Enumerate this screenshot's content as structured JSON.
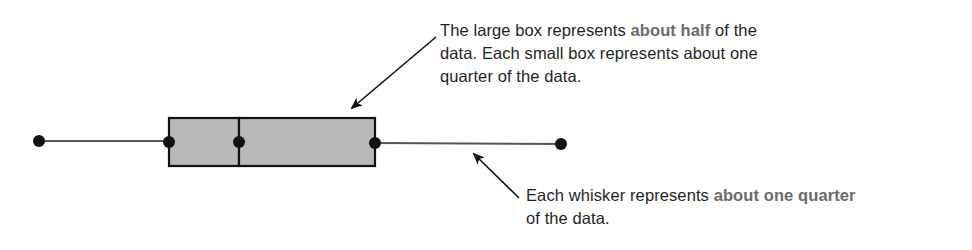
{
  "diagram": {
    "type": "box-and-whisker annotation",
    "colors": {
      "box_fill": "#b9b9b9",
      "outline": "#111111",
      "whisker_line": "#555555",
      "point": "#111111",
      "emphasis_text": "#6b6b6b",
      "body_text": "#1f1f1f"
    },
    "plot": {
      "whisker_y": 142,
      "box_top": 118,
      "box_bottom": 166,
      "points_x": [
        39,
        169,
        239,
        375,
        561
      ],
      "labels": [
        "minimum",
        "lower quartile",
        "median",
        "upper quartile",
        "maximum"
      ]
    }
  },
  "annotations": {
    "box": {
      "part1": "The large box represents ",
      "emph1": "about half",
      "part2": " of the data. Each small box represents about one quarter of the data."
    },
    "whisker": {
      "part1": "Each whisker represents ",
      "emph1": "about one quarter",
      "part2": " of the data."
    }
  }
}
